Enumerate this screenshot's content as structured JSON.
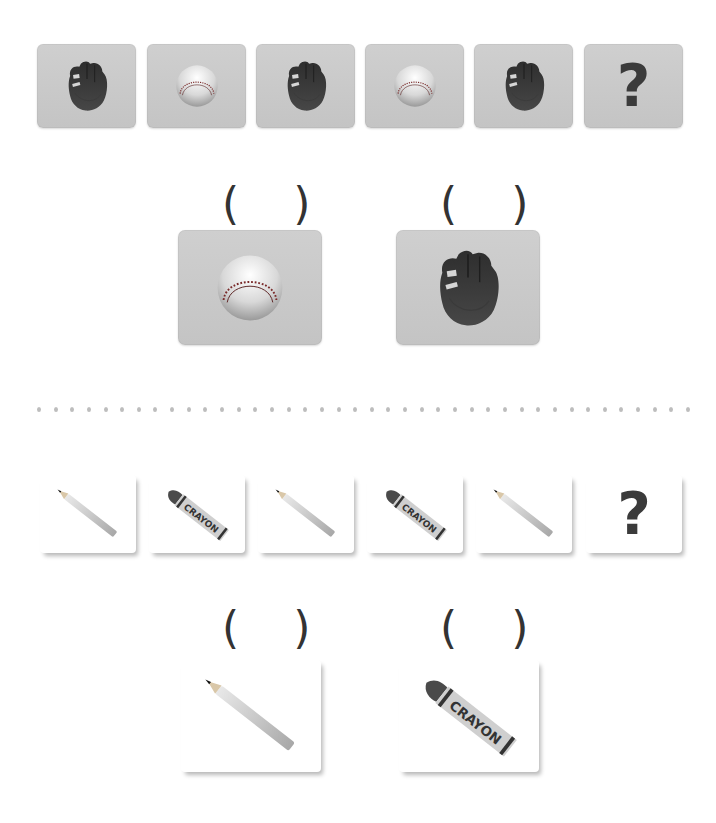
{
  "pattern1": {
    "sequence": [
      {
        "item": "baseball-glove",
        "icon": "baseball-glove-icon"
      },
      {
        "item": "baseball",
        "icon": "baseball-icon"
      },
      {
        "item": "baseball-glove",
        "icon": "baseball-glove-icon"
      },
      {
        "item": "baseball",
        "icon": "baseball-icon"
      },
      {
        "item": "baseball-glove",
        "icon": "baseball-glove-icon"
      },
      {
        "item": "unknown",
        "icon": "question-mark-icon",
        "text": "?"
      }
    ],
    "options": [
      {
        "item": "baseball",
        "icon": "baseball-icon",
        "answer_blank": "(  )"
      },
      {
        "item": "baseball-glove",
        "icon": "baseball-glove-icon",
        "answer_blank": "(  )"
      }
    ]
  },
  "separator": {
    "style": "dotted"
  },
  "pattern2": {
    "sequence": [
      {
        "item": "pencil",
        "icon": "pencil-icon"
      },
      {
        "item": "crayon",
        "icon": "crayon-icon",
        "label": "CRAYON"
      },
      {
        "item": "pencil",
        "icon": "pencil-icon"
      },
      {
        "item": "crayon",
        "icon": "crayon-icon",
        "label": "CRAYON"
      },
      {
        "item": "pencil",
        "icon": "pencil-icon"
      },
      {
        "item": "unknown",
        "icon": "question-mark-icon",
        "text": "?"
      }
    ],
    "options": [
      {
        "item": "pencil",
        "icon": "pencil-icon",
        "answer_blank": "(  )"
      },
      {
        "item": "crayon",
        "icon": "crayon-icon",
        "label": "CRAYON",
        "answer_blank": "(  )"
      }
    ]
  },
  "colors": {
    "card_gray": "#c8c8c8",
    "card_white": "#ffffff",
    "text": "#3b3b3b",
    "dots": "#bdbdbd"
  }
}
